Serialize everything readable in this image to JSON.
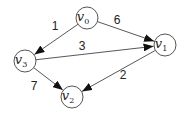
{
  "graph": {
    "directed": true,
    "nodes": [
      {
        "id": "v0",
        "base": "v",
        "sub": "0",
        "cx": 87,
        "cy": 18
      },
      {
        "id": "v1",
        "base": "v",
        "sub": "1",
        "cx": 165,
        "cy": 45
      },
      {
        "id": "v2",
        "base": "v",
        "sub": "2",
        "cx": 72,
        "cy": 97
      },
      {
        "id": "v3",
        "base": "v",
        "sub": "3",
        "cx": 25,
        "cy": 61
      }
    ],
    "edges": [
      {
        "from": "v0",
        "to": "v3",
        "weight": "1",
        "lx": 55,
        "ly": 30
      },
      {
        "from": "v0",
        "to": "v1",
        "weight": "6",
        "lx": 117,
        "ly": 24
      },
      {
        "from": "v3",
        "to": "v1",
        "weight": "3",
        "lx": 82,
        "ly": 50
      },
      {
        "from": "v1",
        "to": "v2",
        "weight": "2",
        "lx": 123,
        "ly": 79
      },
      {
        "from": "v3",
        "to": "v2",
        "weight": "7",
        "lx": 34,
        "ly": 90
      }
    ]
  },
  "style": {
    "node_radius": 11,
    "stroke_color": "#444444",
    "background": "#ffffff"
  }
}
